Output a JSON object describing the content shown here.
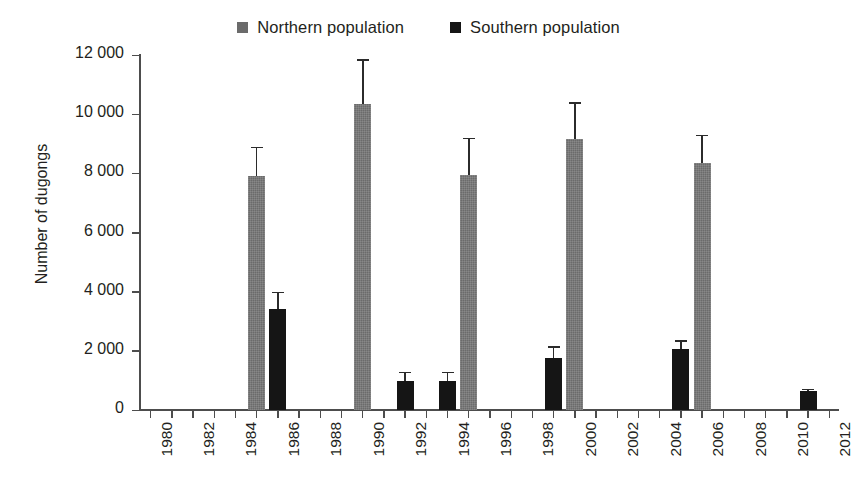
{
  "legend": {
    "items": [
      {
        "label": "Northern population",
        "color": "#6b6b6b",
        "key": "north"
      },
      {
        "label": "Southern population",
        "color": "#151515",
        "key": "south"
      }
    ]
  },
  "chart_data": {
    "type": "bar",
    "title": "",
    "xlabel": "",
    "ylabel": "Number of dugongs",
    "ylim": [
      0,
      12000
    ],
    "ytick_labels": [
      "0",
      "2 000",
      "4 000",
      "6 000",
      "8 000",
      "10 000",
      "12 000"
    ],
    "ytick_values": [
      0,
      2000,
      4000,
      6000,
      8000,
      10000,
      12000
    ],
    "xlim": [
      1979.5,
      2012.5
    ],
    "xtick_values": [
      1980,
      1981,
      1982,
      1983,
      1984,
      1985,
      1986,
      1987,
      1988,
      1989,
      1990,
      1991,
      1992,
      1993,
      1994,
      1995,
      1996,
      1997,
      1998,
      1999,
      2000,
      2001,
      2002,
      2003,
      2004,
      2005,
      2006,
      2007,
      2008,
      2009,
      2010,
      2011,
      2012
    ],
    "xtick_labels": [
      "1980",
      "1982",
      "1984",
      "1986",
      "1988",
      "1990",
      "1992",
      "1994",
      "1996",
      "1998",
      "2000",
      "2002",
      "2004",
      "2006",
      "2008",
      "2010",
      "2012"
    ],
    "xtick_label_values": [
      1980,
      1982,
      1984,
      1986,
      1988,
      1990,
      1992,
      1994,
      1996,
      1998,
      2000,
      2002,
      2004,
      2006,
      2008,
      2010,
      2012
    ],
    "grid": false,
    "legend_position": "top-center",
    "error_bars": "upper-only",
    "series": [
      {
        "name": "Northern population",
        "color": "#6b6b6b",
        "points": [
          {
            "x": 1985,
            "y": 7900,
            "err_high": 8900
          },
          {
            "x": 1990,
            "y": 10350,
            "err_high": 11850
          },
          {
            "x": 1995,
            "y": 7950,
            "err_high": 9200
          },
          {
            "x": 2000,
            "y": 9150,
            "err_high": 10400
          },
          {
            "x": 2006,
            "y": 8350,
            "err_high": 9300
          }
        ]
      },
      {
        "name": "Southern population",
        "color": "#151515",
        "points": [
          {
            "x": 1986,
            "y": 3400,
            "err_high": 4000
          },
          {
            "x": 1992,
            "y": 980,
            "err_high": 1300
          },
          {
            "x": 1994,
            "y": 980,
            "err_high": 1300
          },
          {
            "x": 1999,
            "y": 1750,
            "err_high": 2150
          },
          {
            "x": 2005,
            "y": 2050,
            "err_high": 2350
          },
          {
            "x": 2011,
            "y": 650,
            "err_high": 720
          }
        ]
      }
    ]
  }
}
